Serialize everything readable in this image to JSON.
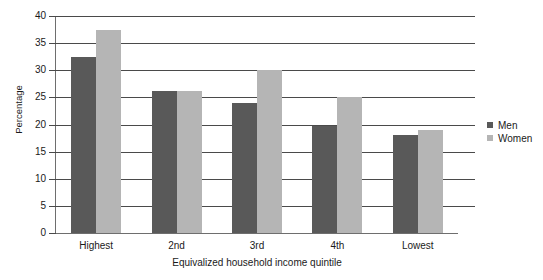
{
  "chart_data": {
    "type": "bar",
    "title": "",
    "subtitle": "",
    "xlabel": "Equivalized household income quintile",
    "ylabel": "Percentage",
    "categories": [
      "Highest",
      "2nd",
      "3rd",
      "4th",
      "Lowest"
    ],
    "series": [
      {
        "name": "Men",
        "color": "#595959",
        "values": [
          32.4,
          26.2,
          24.0,
          19.8,
          18.0
        ]
      },
      {
        "name": "Women",
        "color": "#b5b5b5",
        "values": [
          37.4,
          26.2,
          30.0,
          25.0,
          19.0
        ]
      }
    ],
    "ylim": [
      0,
      40
    ],
    "yticks": [
      0,
      5,
      10,
      15,
      20,
      25,
      30,
      35,
      40
    ],
    "ytick_labels": [
      "0",
      "5",
      "10",
      "15",
      "20",
      "25",
      "30",
      "35",
      "40"
    ],
    "grid": true,
    "grid_axis": "y",
    "legend_position": "right",
    "legend_entries": [
      "Men",
      "Women"
    ]
  }
}
